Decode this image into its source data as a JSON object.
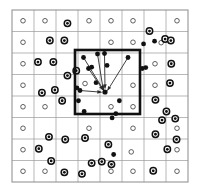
{
  "figure": {
    "canvas": {
      "width": 200,
      "height": 194,
      "background": "#ffffff"
    },
    "grid": {
      "x0": 12,
      "y0": 10,
      "x1": 188,
      "y1": 182,
      "cols": 8,
      "rows": 8,
      "line_color": "#9a9a9a",
      "line_width": 0.7,
      "border_color": "#8a8a8a",
      "border_width": 1.0
    },
    "highlight_box": {
      "x0": 75,
      "y0": 50,
      "x1": 140,
      "y1": 114,
      "stroke": "#111111",
      "stroke_width": 2.6,
      "fill": "none"
    },
    "markers": {
      "open_color": "#ffffff",
      "open_stroke": "#3a3a3a",
      "open_radius": 2.3,
      "filled_color": "#111111",
      "filled_radius": 2.4,
      "bullseye_outer_radius": 3.2,
      "bullseye_inner_radius": 1.4,
      "bullseye_ring_color": "#111111"
    },
    "arrows": {
      "stroke": "#2a2a2a",
      "stroke_width": 0.9,
      "head_length": 4.5,
      "head_width": 3.0,
      "target": {
        "x": 105,
        "y": 92
      }
    }
  },
  "chart_data": {
    "type": "scatter",
    "title": "",
    "xlabel": "",
    "ylabel": "",
    "xlim": [
      0,
      8
    ],
    "ylim": [
      0,
      8
    ],
    "grid": true,
    "legend": "none",
    "annotations": [
      "bold square region of interest spans cells col4-col6, row3-row5",
      "six arrows converge from surrounding filled points to a single target point"
    ],
    "series": [
      {
        "name": "lattice-centers-open",
        "marker": "open-circle",
        "points": [
          [
            0.5,
            0.5
          ],
          [
            1.5,
            0.5
          ],
          [
            3.5,
            0.5
          ],
          [
            4.5,
            0.5
          ],
          [
            5.5,
            0.5
          ],
          [
            7.5,
            0.5
          ],
          [
            0.5,
            1.5
          ],
          [
            4.5,
            1.5
          ],
          [
            5.5,
            1.5
          ],
          [
            6.78,
            1.52
          ],
          [
            0.5,
            2.5
          ],
          [
            6.5,
            2.5
          ],
          [
            0.5,
            3.5
          ],
          [
            3.32,
            3.42
          ],
          [
            5.5,
            3.5
          ],
          [
            6.5,
            3.5
          ],
          [
            0.5,
            4.5
          ],
          [
            1.5,
            4.5
          ],
          [
            4.5,
            4.5
          ],
          [
            5.5,
            4.5
          ],
          [
            0.5,
            5.5
          ],
          [
            3.5,
            5.5
          ],
          [
            5.5,
            5.5
          ],
          [
            7.5,
            5.5
          ],
          [
            0.5,
            6.5
          ],
          [
            5.42,
            6.6
          ],
          [
            7.5,
            6.5
          ],
          [
            0.5,
            7.5
          ],
          [
            1.5,
            7.5
          ],
          [
            4.5,
            7.5
          ],
          [
            5.5,
            7.5
          ],
          [
            7.5,
            7.5
          ]
        ]
      },
      {
        "name": "scatter-filled-bullseye",
        "marker": "bullseye",
        "points": [
          [
            2.52,
            0.62
          ],
          [
            6.25,
            0.98
          ],
          [
            1.72,
            1.42
          ],
          [
            2.38,
            1.42
          ],
          [
            6.96,
            1.35
          ],
          [
            7.22,
            1.42
          ],
          [
            1.18,
            2.42
          ],
          [
            1.88,
            2.42
          ],
          [
            7.24,
            2.5
          ],
          [
            2.52,
            3.05
          ],
          [
            2.92,
            2.82
          ],
          [
            7.18,
            3.4
          ],
          [
            1.36,
            3.85
          ],
          [
            1.95,
            3.72
          ],
          [
            2.28,
            4.22
          ],
          [
            6.52,
            4.18
          ],
          [
            7.02,
            4.72
          ],
          [
            6.82,
            5.12
          ],
          [
            7.42,
            5.05
          ],
          [
            1.68,
            5.9
          ],
          [
            2.42,
            6.02
          ],
          [
            3.32,
            5.95
          ],
          [
            6.52,
            5.78
          ],
          [
            7.48,
            6.02
          ],
          [
            1.22,
            6.45
          ],
          [
            4.38,
            6.25
          ],
          [
            7.06,
            6.48
          ],
          [
            1.78,
            7.02
          ],
          [
            4.08,
            7.05
          ],
          [
            4.52,
            7.18
          ],
          [
            3.62,
            7.12
          ],
          [
            2.38,
            7.55
          ],
          [
            3.18,
            7.62
          ],
          [
            6.42,
            7.48
          ]
        ]
      },
      {
        "name": "cluster-inside-and-near-box",
        "marker": "filled-dot",
        "points": [
          [
            3.62,
            2.66
          ],
          [
            4.32,
            2.58
          ],
          [
            5.92,
            2.72
          ],
          [
            6.08,
            2.68
          ],
          [
            2.95,
            3.62
          ],
          [
            3.82,
            3.38
          ],
          [
            3.02,
            4.22
          ],
          [
            4.88,
            4.22
          ],
          [
            4.72,
            4.82
          ],
          [
            3.28,
            4.72
          ],
          [
            4.55,
            5.02
          ],
          [
            5.98,
            1.58
          ],
          [
            6.48,
            1.45
          ],
          [
            4.62,
            6.72
          ]
        ]
      }
    ],
    "arrow_segments": [
      {
        "from": [
          83.5,
          57.5
        ],
        "to": [
          104.2,
          91.0
        ]
      },
      {
        "from": [
          97.5,
          54.0
        ],
        "to": [
          103.2,
          89.5
        ]
      },
      {
        "from": [
          104.5,
          53.5
        ],
        "to": [
          105.0,
          88.5
        ]
      },
      {
        "from": [
          88.5,
          68.5
        ],
        "to": [
          103.0,
          90.0
        ]
      },
      {
        "from": [
          80.0,
          90.5
        ],
        "to": [
          101.5,
          92.2
        ]
      },
      {
        "from": [
          128.0,
          57.5
        ],
        "to": [
          107.5,
          90.5
        ]
      }
    ]
  }
}
